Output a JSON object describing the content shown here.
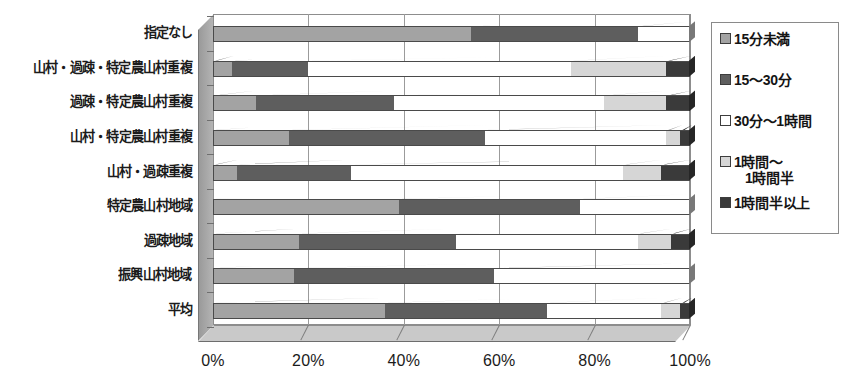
{
  "chart_data": {
    "type": "bar",
    "orientation": "horizontal",
    "stacked": true,
    "stack_mode": "percent",
    "title": "",
    "xlabel": "",
    "ylabel": "",
    "xlim": [
      0,
      100
    ],
    "xticks": [
      0,
      20,
      40,
      60,
      80,
      100
    ],
    "xtick_labels": [
      "0%",
      "20%",
      "40%",
      "60%",
      "80%",
      "100%"
    ],
    "grid": true,
    "legend_position": "right",
    "categories": [
      "指定なし",
      "山村・過疎・特定農山村重複",
      "過疎・特定農山村重複",
      "山村・特定農山村重複",
      "山村・過疎重複",
      "特定農山村地域",
      "過疎地域",
      "振興山村地域",
      "平均"
    ],
    "series": [
      {
        "name": "15分未満",
        "color": "#a3a3a3",
        "values": [
          54.0,
          4.0,
          9.0,
          16.0,
          5.0,
          39.0,
          18.0,
          17.0,
          36.0
        ]
      },
      {
        "name": "15～30分",
        "color": "#5e5e5e",
        "values": [
          35.0,
          16.0,
          29.0,
          41.0,
          24.0,
          38.0,
          33.0,
          42.0,
          34.0
        ]
      },
      {
        "name": "30分～1時間",
        "color": "#ffffff",
        "values": [
          11.0,
          55.0,
          44.0,
          38.0,
          57.0,
          23.0,
          38.0,
          41.0,
          24.0
        ]
      },
      {
        "name": "1時間～1時間半",
        "color": "#d6d6d6",
        "values": [
          0.0,
          20.0,
          13.0,
          3.0,
          8.0,
          0.0,
          7.0,
          0.0,
          4.0
        ]
      },
      {
        "name": "1時間半以上",
        "color": "#3a3a3a",
        "values": [
          0.0,
          5.0,
          5.0,
          2.0,
          6.0,
          0.0,
          4.0,
          0.0,
          2.0
        ]
      }
    ],
    "legend_entries": [
      {
        "label": "15分未満",
        "label_line2": "",
        "color": "#a3a3a3"
      },
      {
        "label": "15～30分",
        "label_line2": "",
        "color": "#5e5e5e"
      },
      {
        "label": "30分～1時間",
        "label_line2": "",
        "color": "#ffffff"
      },
      {
        "label": "1時間～",
        "label_line2": "1時間半",
        "color": "#d6d6d6"
      },
      {
        "label": "1時間半以上",
        "label_line2": "",
        "color": "#3a3a3a"
      }
    ]
  },
  "footnote": ""
}
